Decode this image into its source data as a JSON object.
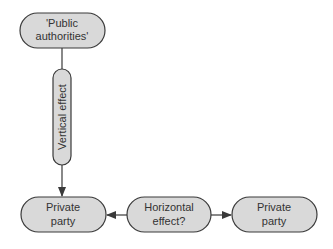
{
  "diagram": {
    "nodes": {
      "public_authorities": {
        "line1": "'Public",
        "line2": "authorities'"
      },
      "vertical_effect": {
        "label": "Vertical effect"
      },
      "private_party_left": {
        "line1": "Private",
        "line2": "party"
      },
      "horizontal_effect": {
        "line1": "Horizontal",
        "line2": "effect?"
      },
      "private_party_right": {
        "line1": "Private",
        "line2": "party"
      }
    },
    "colors": {
      "node_fill": "#d9d9d9",
      "stroke": "#3a3a3a"
    }
  }
}
